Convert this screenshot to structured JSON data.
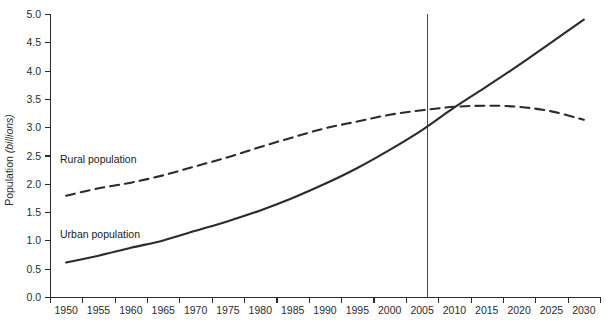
{
  "chart_data": {
    "type": "line",
    "title": "",
    "xlabel": "",
    "ylabel": "Population",
    "ylabel_unit": "(billions)",
    "ylim": [
      0.0,
      5.0
    ],
    "ytick_step": 0.5,
    "xlim": [
      1950,
      2030
    ],
    "xtick_step": 5,
    "grid": false,
    "legend_position": "inline-left",
    "yticks": [
      "0.0",
      "0.5",
      "1.0",
      "1.5",
      "2.0",
      "2.5",
      "3.0",
      "3.5",
      "4.0",
      "4.5",
      "5.0"
    ],
    "ytick_values": [
      0.0,
      0.5,
      1.0,
      1.5,
      2.0,
      2.5,
      3.0,
      3.5,
      4.0,
      4.5,
      5.0
    ],
    "xticks": [
      "1950",
      "1955",
      "1960",
      "1965",
      "1970",
      "1975",
      "1980",
      "1985",
      "1990",
      "1995",
      "2000",
      "2005",
      "2010",
      "2015",
      "2020",
      "2025",
      "2030"
    ],
    "x": [
      1950,
      1955,
      1960,
      1965,
      1970,
      1975,
      1980,
      1985,
      1990,
      1995,
      2000,
      2005,
      2010,
      2015,
      2020,
      2025,
      2030
    ],
    "series": [
      {
        "name": "Rural population",
        "style": "dashed",
        "color": "#2b2b2b",
        "values": [
          1.79,
          1.92,
          2.02,
          2.15,
          2.31,
          2.47,
          2.65,
          2.82,
          2.98,
          3.1,
          3.22,
          3.3,
          3.36,
          3.38,
          3.36,
          3.28,
          3.13
        ]
      },
      {
        "name": "Urban population",
        "style": "solid",
        "color": "#2b2b2b",
        "values": [
          0.61,
          0.73,
          0.87,
          1.0,
          1.17,
          1.34,
          1.53,
          1.75,
          2.0,
          2.28,
          2.6,
          2.95,
          3.35,
          3.72,
          4.1,
          4.5,
          4.9
        ]
      }
    ],
    "annotations": [
      {
        "name": "reference-line",
        "type": "vline",
        "x": 2005.8,
        "label": ""
      }
    ],
    "series_labels": [
      {
        "text": "Rural population",
        "x_px": 60,
        "y_px": 163
      },
      {
        "text": "Urban population",
        "x_px": 60,
        "y_px": 238
      }
    ]
  }
}
